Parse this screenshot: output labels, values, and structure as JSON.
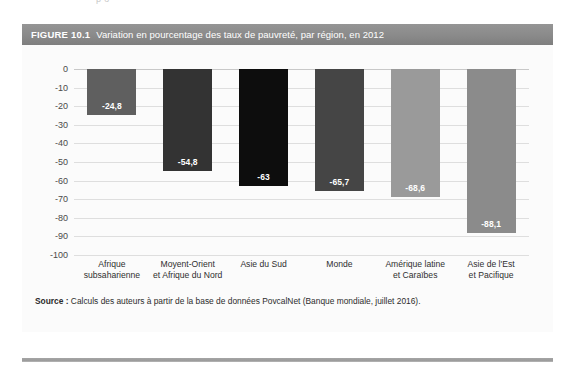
{
  "page": {
    "bleed_text": "p                  o"
  },
  "figure": {
    "number_label": "FIGURE 10.1",
    "title": "Variation en pourcentage des taux de pauvreté, par région, en 2012",
    "header_bg": "#8a8a8a",
    "panel_bg": "#fbfbfb",
    "source_prefix": "Source :",
    "source_text": " Calculs des auteurs à partir de la base de données PovcalNet (Banque mondiale, juillet 2016)."
  },
  "chart_data": {
    "type": "bar",
    "title": "Variation en pourcentage des taux de pauvreté, par région, en 2012",
    "xlabel": "",
    "ylabel": "",
    "ylim": [
      -100,
      0
    ],
    "ytick_step": 10,
    "grid": true,
    "legend": "none",
    "orientation": "vertical-negative",
    "categories": [
      "Afrique subsaharienne",
      "Moyent-Orient et Afrique du Nord",
      "Asie du Sud",
      "Monde",
      "Amérique latine et Caraïbes",
      "Asie de l'Est et Pacifique"
    ],
    "category_lines": [
      [
        "Afrique",
        "subsaharienne"
      ],
      [
        "Moyent-Orient",
        "et Afrique du Nord"
      ],
      [
        "Asie du Sud",
        ""
      ],
      [
        "Monde",
        ""
      ],
      [
        "Amérique latine",
        "et Caraïbes"
      ],
      [
        "Asie de l'Est",
        "et Pacifique"
      ]
    ],
    "values": [
      -24.8,
      -54.8,
      -63,
      -65.7,
      -68.6,
      -88.1
    ],
    "value_labels": [
      "-24,8",
      "-54,8",
      "-63",
      "-65,7",
      "-68,6",
      "-88,1"
    ],
    "bar_colors": [
      "#5f5f5f",
      "#333333",
      "#0d0d0d",
      "#454545",
      "#9a9a9a",
      "#8b8b8b"
    ],
    "ytick_labels": [
      "0",
      "-10",
      "-20",
      "-30",
      "-40",
      "-50",
      "-60",
      "-70",
      "-80",
      "-90",
      "-100"
    ],
    "ytick_values": [
      0,
      -10,
      -20,
      -30,
      -40,
      -50,
      -60,
      -70,
      -80,
      -90,
      -100
    ]
  }
}
